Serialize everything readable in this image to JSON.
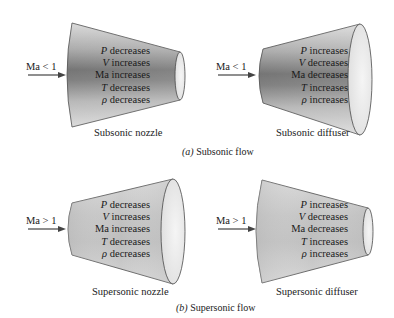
{
  "panels": [
    {
      "id": "subsonic_nozzle",
      "inlet_label": "Ma < 1",
      "caption": "Subsonic nozzle",
      "properties": [
        {
          "symbol": "P",
          "change": " decreases"
        },
        {
          "symbol": "V",
          "change": " increases"
        },
        {
          "symbol": "Ma",
          "change": " increases",
          "symbol_italic": false
        },
        {
          "symbol": "T",
          "change": " decreases"
        },
        {
          "symbol": "ρ",
          "change": " decreases"
        }
      ]
    },
    {
      "id": "subsonic_diffuser",
      "inlet_label": "Ma < 1",
      "caption": "Subsonic diffuser",
      "properties": [
        {
          "symbol": "P",
          "change": " increases"
        },
        {
          "symbol": "V",
          "change": " decreases"
        },
        {
          "symbol": "Ma",
          "change": " decreases",
          "symbol_italic": false
        },
        {
          "symbol": "T",
          "change": " increases"
        },
        {
          "symbol": "ρ",
          "change": " increases"
        }
      ]
    },
    {
      "id": "supersonic_nozzle",
      "inlet_label": "Ma > 1",
      "caption": "Supersonic nozzle",
      "properties": [
        {
          "symbol": "P",
          "change": " decreases"
        },
        {
          "symbol": "V",
          "change": " increases"
        },
        {
          "symbol": "Ma",
          "change": " increases",
          "symbol_italic": false
        },
        {
          "symbol": "T",
          "change": " decreases"
        },
        {
          "symbol": "ρ",
          "change": " decreases"
        }
      ]
    },
    {
      "id": "supersonic_diffuser",
      "inlet_label": "Ma > 1",
      "caption": "Supersonic diffuser",
      "properties": [
        {
          "symbol": "P",
          "change": " increases"
        },
        {
          "symbol": "V",
          "change": " decreases"
        },
        {
          "symbol": "Ma",
          "change": " decreases",
          "symbol_italic": false
        },
        {
          "symbol": "T",
          "change": " increases"
        },
        {
          "symbol": "ρ",
          "change": " increases"
        }
      ]
    }
  ],
  "sections": {
    "a": {
      "letter": "(a)",
      "title": " Subsonic flow"
    },
    "b": {
      "letter": "(b)",
      "title": " Supersonic flow"
    }
  },
  "colors": {
    "subsonic_dark_band": "#6e6e6e",
    "subsonic_light": "#d8d8d8",
    "supersonic_fill": "#c9c9c9",
    "outline": "#4a4a4a",
    "end_face": "#ececec"
  }
}
